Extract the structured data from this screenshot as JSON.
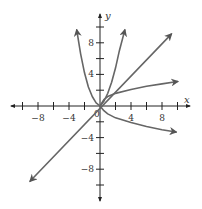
{
  "chart_data": {
    "type": "line",
    "title": "",
    "xlabel": "x",
    "ylabel": "y",
    "xlim": [
      -11,
      11
    ],
    "ylim": [
      -11,
      11
    ],
    "grid": false,
    "x_ticks": [
      -10,
      -8,
      -6,
      -4,
      -2,
      2,
      4,
      6,
      8,
      10
    ],
    "x_tick_labels": [
      {
        "v": -8,
        "t": "−8"
      },
      {
        "v": -4,
        "t": "−4"
      },
      {
        "v": 4,
        "t": "4"
      },
      {
        "v": 8,
        "t": "8"
      }
    ],
    "y_ticks": [
      -10,
      -8,
      -6,
      -4,
      -2,
      2,
      4,
      6,
      8,
      10
    ],
    "y_tick_labels": [
      {
        "v": 8,
        "t": "8"
      },
      {
        "v": 4,
        "t": "4"
      },
      {
        "v": -4,
        "t": "−4"
      },
      {
        "v": -8,
        "t": "−8"
      }
    ],
    "origin_label": "0",
    "series": [
      {
        "name": "left-rising-curve",
        "description": "curve rising steeply to upper left",
        "points": [
          [
            0,
            0
          ],
          [
            -0.5,
            0.4
          ],
          [
            -1,
            1.2
          ],
          [
            -1.5,
            2.4
          ],
          [
            -2,
            4.2
          ],
          [
            -2.5,
            6.6
          ],
          [
            -3,
            9.6
          ]
        ]
      },
      {
        "name": "right-steep-curve",
        "description": "curve rising steeply to upper right",
        "points": [
          [
            0,
            0
          ],
          [
            0.5,
            0.6
          ],
          [
            1,
            1.6
          ],
          [
            1.5,
            3.0
          ],
          [
            2,
            4.8
          ],
          [
            2.5,
            7.0
          ],
          [
            3.2,
            9.6
          ]
        ]
      },
      {
        "name": "identity-line",
        "description": "straight line y = x through origin, arrows both ends",
        "points": [
          [
            -9,
            -9.5
          ],
          [
            9.2,
            9.1
          ]
        ]
      },
      {
        "name": "right-slow-curve",
        "description": "curve rising slowly to the right",
        "points": [
          [
            0,
            0
          ],
          [
            0.5,
            0.8
          ],
          [
            1,
            1.2
          ],
          [
            2,
            1.6
          ],
          [
            4,
            2.1
          ],
          [
            6,
            2.5
          ],
          [
            8,
            2.8
          ],
          [
            10,
            3.1
          ]
        ]
      },
      {
        "name": "right-decreasing-curve",
        "description": "curve descending slowly to the right",
        "points": [
          [
            0,
            0
          ],
          [
            0.5,
            -0.6
          ],
          [
            1,
            -1.0
          ],
          [
            2,
            -1.5
          ],
          [
            4,
            -2.1
          ],
          [
            6,
            -2.6
          ],
          [
            8,
            -3.0
          ],
          [
            9.8,
            -3.3
          ]
        ]
      }
    ]
  }
}
